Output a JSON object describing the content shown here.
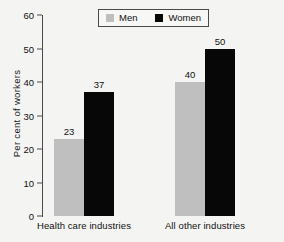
{
  "chart_data": {
    "type": "bar",
    "title": "",
    "xlabel": "",
    "ylabel": "Per cent of workers",
    "ylim": [
      0,
      60
    ],
    "ytick_labels": [
      "0",
      "10",
      "20",
      "30",
      "40",
      "50",
      "60"
    ],
    "ytick_values": [
      0,
      10,
      20,
      30,
      40,
      50,
      60
    ],
    "grid": false,
    "legend_position": "top-center",
    "categories": [
      "Health care industries",
      "All other industries"
    ],
    "series": [
      {
        "name": "Men",
        "color": "#bfbfbf",
        "values": [
          23,
          40
        ],
        "labels": [
          "23",
          "40"
        ]
      },
      {
        "name": "Women",
        "color": "#070707",
        "values": [
          37,
          50
        ],
        "labels": [
          "37",
          "50"
        ]
      }
    ]
  },
  "legend": {
    "entries": [
      {
        "label": "Men",
        "swatch": "men-swatch"
      },
      {
        "label": "Women",
        "swatch": "women-swatch"
      }
    ]
  }
}
